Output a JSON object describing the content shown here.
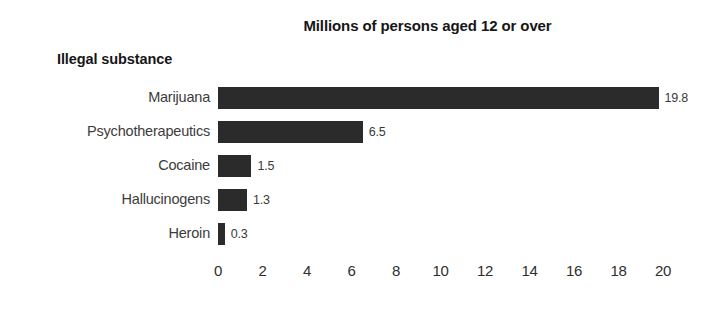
{
  "chart_data": {
    "type": "bar",
    "orientation": "horizontal",
    "title": "Millions of persons aged 12 or over",
    "xlabel": "",
    "ylabel": "Illegal substance",
    "categories": [
      "Marijuana",
      "Psychotherapeutics",
      "Cocaine",
      "Hallucinogens",
      "Heroin"
    ],
    "values": [
      19.8,
      6.5,
      1.5,
      1.3,
      0.3
    ],
    "value_labels": [
      "19.8",
      "6.5",
      "1.5",
      "1.3",
      "0.3"
    ],
    "xlim": [
      0,
      20
    ],
    "xticks": [
      0,
      2,
      4,
      6,
      8,
      10,
      12,
      14,
      16,
      18,
      20
    ],
    "xtick_labels": [
      "0",
      "2",
      "4",
      "6",
      "8",
      "10",
      "12",
      "14",
      "16",
      "18",
      "20"
    ],
    "grid": false,
    "legend": false,
    "bar_color": "#2b2b2b",
    "background_color": "#ffffff",
    "text_color": "#1a1a1a"
  }
}
